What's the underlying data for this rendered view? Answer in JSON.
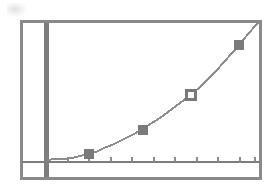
{
  "image": {
    "kind": "graphing-calculator-screen",
    "description": "Scanned graphing calculator screen showing an increasing exponential curve with four plotted point markers",
    "width": 279,
    "height": 195
  },
  "colors": {
    "background": "#ffffff",
    "frame": "#8a8a8a",
    "axis": "#7d7d7d",
    "curve": "#8c8c8c",
    "marker_fill": "#7a7a7a",
    "marker_open_fill": "#ffffff",
    "marker_stroke": "#7a7a7a",
    "tick": "#8a8a8a"
  },
  "frame": {
    "x": 20,
    "y": 20,
    "width": 242,
    "height": 160,
    "stroke_width": 3
  },
  "chart_data": {
    "type": "line",
    "title": "",
    "subtitle": "",
    "xlabel": "",
    "ylabel": "",
    "grid": false,
    "legend": "none",
    "xlim": [
      0,
      10
    ],
    "ylim": [
      0,
      10
    ],
    "axis": {
      "y_axis_x": 46,
      "y_axis_width": 5,
      "x_axis_y": 162,
      "x_axis_width": 2,
      "x_axis_start": 22,
      "x_axis_end": 260,
      "tick_count": 10,
      "tick_spacing": 21.5,
      "tick_length": 5,
      "tick_positions": [
        68,
        89,
        111,
        132,
        154,
        175,
        197,
        218,
        240,
        255
      ]
    },
    "curve": {
      "name": "exponential growth",
      "style": "aliased-pixel-stair",
      "points": [
        {
          "x": 47,
          "y": 160
        },
        {
          "x": 56,
          "y": 159
        },
        {
          "x": 64,
          "y": 159
        },
        {
          "x": 72,
          "y": 158
        },
        {
          "x": 80,
          "y": 156
        },
        {
          "x": 88,
          "y": 154
        },
        {
          "x": 96,
          "y": 152
        },
        {
          "x": 104,
          "y": 148
        },
        {
          "x": 112,
          "y": 145
        },
        {
          "x": 120,
          "y": 141
        },
        {
          "x": 128,
          "y": 137
        },
        {
          "x": 136,
          "y": 133
        },
        {
          "x": 144,
          "y": 128
        },
        {
          "x": 152,
          "y": 123
        },
        {
          "x": 160,
          "y": 118
        },
        {
          "x": 168,
          "y": 112
        },
        {
          "x": 176,
          "y": 106
        },
        {
          "x": 184,
          "y": 100
        },
        {
          "x": 192,
          "y": 94
        },
        {
          "x": 200,
          "y": 87
        },
        {
          "x": 208,
          "y": 79
        },
        {
          "x": 216,
          "y": 71
        },
        {
          "x": 224,
          "y": 62
        },
        {
          "x": 232,
          "y": 53
        },
        {
          "x": 240,
          "y": 44
        },
        {
          "x": 248,
          "y": 34
        },
        {
          "x": 256,
          "y": 25
        },
        {
          "x": 261,
          "y": 21
        }
      ]
    },
    "markers": [
      {
        "index": 1,
        "x": 89,
        "y": 154,
        "style": "filled-square",
        "size": 9
      },
      {
        "index": 2,
        "x": 143,
        "y": 130,
        "style": "filled-square",
        "size": 9
      },
      {
        "index": 3,
        "x": 191,
        "y": 95,
        "style": "open-square",
        "size": 9
      },
      {
        "index": 4,
        "x": 239,
        "y": 45,
        "style": "filled-square",
        "size": 9
      }
    ]
  },
  "artifacts": {
    "smudge_label": "scan-smudge-top-left"
  }
}
